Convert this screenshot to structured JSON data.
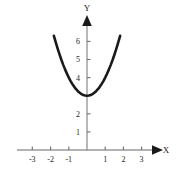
{
  "chart_data": {
    "type": "line",
    "title": "",
    "subtitle": "",
    "xlabel": "X",
    "ylabel": "Y",
    "xlim": [
      -3.6,
      3.6
    ],
    "ylim": [
      -0.9,
      6.9
    ],
    "grid": false,
    "legend": null,
    "xticks": [
      -3,
      -2,
      -1,
      1,
      2,
      3
    ],
    "xtick_labels": [
      "-3",
      "-2",
      "-1",
      "1",
      "2",
      "3"
    ],
    "yticks": [
      1,
      2,
      3,
      4,
      5,
      6
    ],
    "ytick_labels": [
      "1",
      "2",
      "3",
      "4",
      "5",
      "6"
    ],
    "ytick_labels_visible": [
      "1",
      "2",
      "4",
      "5",
      "6"
    ],
    "series": [
      {
        "name": "y = x^2 + 3",
        "equation": "y = x^2 + 3",
        "vertex": [
          0,
          3
        ],
        "x": [
          -1.82,
          -1.7,
          -1.6,
          -1.5,
          -1.4,
          -1.3,
          -1.2,
          -1.1,
          -1.0,
          -0.9,
          -0.8,
          -0.7,
          -0.6,
          -0.5,
          -0.4,
          -0.3,
          -0.2,
          -0.1,
          0.0,
          0.1,
          0.2,
          0.3,
          0.4,
          0.5,
          0.6,
          0.7,
          0.8,
          0.9,
          1.0,
          1.1,
          1.2,
          1.3,
          1.4,
          1.5,
          1.6,
          1.7,
          1.82
        ],
        "y": [
          6.31,
          5.89,
          5.56,
          5.25,
          4.96,
          4.69,
          4.44,
          4.21,
          4.0,
          3.81,
          3.64,
          3.49,
          3.36,
          3.25,
          3.16,
          3.09,
          3.04,
          3.01,
          3.0,
          3.01,
          3.04,
          3.09,
          3.16,
          3.25,
          3.36,
          3.49,
          3.64,
          3.81,
          4.0,
          4.21,
          4.44,
          4.69,
          4.96,
          5.25,
          5.56,
          5.89,
          6.31
        ]
      }
    ],
    "colors": {
      "curve": "#1a1a1a",
      "axis": "#9a9a9a",
      "text": "#231f20",
      "background": "#ffffff"
    }
  },
  "axes": {
    "x_axis_label": "X",
    "y_axis_label": "Y"
  }
}
